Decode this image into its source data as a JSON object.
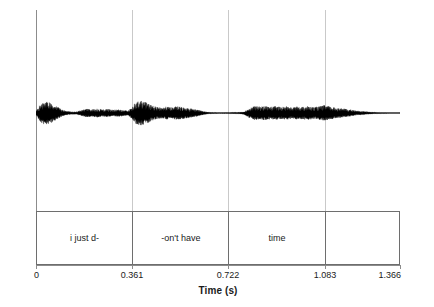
{
  "chart_data": {
    "type": "line",
    "title": "",
    "subtitle": "",
    "xlabel": "Time (s)",
    "ylabel": "Amplitude (Pa)",
    "xlim": [
      0,
      1.366
    ],
    "ylim": [
      -1,
      1
    ],
    "grid": "vertical-only",
    "legend": "none",
    "xticks": [
      {
        "value": 0,
        "label": "0"
      },
      {
        "value": 0.361,
        "label": "0.361"
      },
      {
        "value": 0.722,
        "label": "0.722"
      },
      {
        "value": 1.083,
        "label": "1.083"
      },
      {
        "value": 1.366,
        "label": "1.366"
      }
    ],
    "yticks": [],
    "gridlines_x": [
      0.361,
      0.722,
      1.083
    ],
    "series": [
      {
        "name": "speech waveform",
        "description": "acoustic oscillogram (amplitude vs time) of the utterance",
        "color": "#000000",
        "envelope_t": [
          0.0,
          0.012,
          0.025,
          0.04,
          0.055,
          0.07,
          0.085,
          0.1,
          0.115,
          0.13,
          0.15,
          0.17,
          0.19,
          0.21,
          0.23,
          0.25,
          0.27,
          0.29,
          0.31,
          0.33,
          0.345,
          0.361,
          0.375,
          0.39,
          0.405,
          0.42,
          0.435,
          0.45,
          0.47,
          0.49,
          0.51,
          0.53,
          0.55,
          0.57,
          0.59,
          0.61,
          0.63,
          0.65,
          0.67,
          0.69,
          0.71,
          0.722,
          0.74,
          0.76,
          0.78,
          0.8,
          0.82,
          0.84,
          0.86,
          0.88,
          0.9,
          0.92,
          0.94,
          0.96,
          0.98,
          1.0,
          1.02,
          1.04,
          1.06,
          1.083,
          1.1,
          1.12,
          1.14,
          1.16,
          1.18,
          1.2,
          1.22,
          1.24,
          1.26,
          1.28,
          1.3,
          1.32,
          1.34,
          1.366
        ],
        "envelope_amplitude": [
          0.14,
          0.52,
          0.78,
          0.86,
          0.74,
          0.58,
          0.4,
          0.22,
          0.14,
          0.1,
          0.09,
          0.2,
          0.3,
          0.26,
          0.31,
          0.24,
          0.29,
          0.22,
          0.27,
          0.2,
          0.16,
          0.42,
          0.8,
          0.9,
          0.82,
          0.7,
          0.55,
          0.44,
          0.38,
          0.46,
          0.41,
          0.48,
          0.42,
          0.36,
          0.3,
          0.22,
          0.12,
          0.06,
          0.04,
          0.03,
          0.03,
          0.04,
          0.05,
          0.06,
          0.1,
          0.34,
          0.5,
          0.46,
          0.52,
          0.44,
          0.5,
          0.42,
          0.48,
          0.4,
          0.46,
          0.44,
          0.5,
          0.42,
          0.46,
          0.56,
          0.48,
          0.4,
          0.34,
          0.3,
          0.24,
          0.18,
          0.13,
          0.1,
          0.07,
          0.05,
          0.04,
          0.03,
          0.02,
          0.02
        ]
      }
    ],
    "annotation_tier": {
      "name": "word tier",
      "intervals": [
        {
          "label": "i just d-",
          "start": 0,
          "end": 0.361
        },
        {
          "label": "-on't have",
          "start": 0.361,
          "end": 0.722
        },
        {
          "label": "time",
          "start": 0.722,
          "end": 1.083
        },
        {
          "label": "",
          "start": 1.083,
          "end": 1.366
        }
      ]
    },
    "colors": {
      "waveform": "#000000",
      "axis": "#8c8c8c",
      "gridline": "#c9c9c9",
      "tier_border": "#6e6e6e",
      "text": "#1a1a1a",
      "background": "#ffffff"
    }
  }
}
